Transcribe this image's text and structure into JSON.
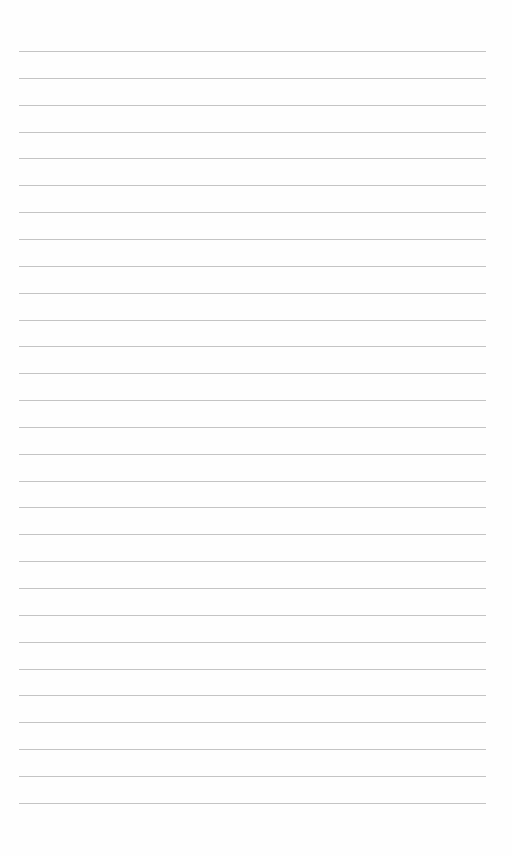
{
  "page": {
    "type": "blank lined paper",
    "line_count": 29,
    "first_line_y": 51,
    "line_spacing": 26.85,
    "line_left": 19,
    "line_right": 486,
    "line_color": "#c4c4c4",
    "background_color": "#fefefe"
  }
}
